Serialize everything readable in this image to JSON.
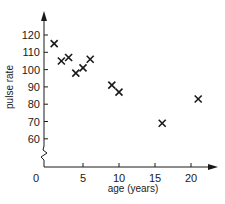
{
  "chart_data": {
    "type": "scatter",
    "title": "",
    "xlabel": "age (years)",
    "ylabel": "pulse rate",
    "x_ticks": [
      0,
      5,
      10,
      15,
      20
    ],
    "y_ticks": [
      60,
      70,
      80,
      90,
      100,
      110,
      120
    ],
    "xlim": [
      0,
      23
    ],
    "ylim": [
      50,
      130
    ],
    "y_axis_break": true,
    "grid": false,
    "legend": null,
    "marker": "x",
    "points": [
      {
        "x": 1,
        "y": 115
      },
      {
        "x": 2,
        "y": 105
      },
      {
        "x": 3,
        "y": 107
      },
      {
        "x": 4,
        "y": 98
      },
      {
        "x": 5,
        "y": 101
      },
      {
        "x": 6,
        "y": 106
      },
      {
        "x": 9,
        "y": 91
      },
      {
        "x": 10,
        "y": 87
      },
      {
        "x": 16,
        "y": 69
      },
      {
        "x": 21,
        "y": 83
      }
    ]
  },
  "labels": {
    "xlabel": "age (years)",
    "ylabel": "pulse rate",
    "origin": "0"
  }
}
